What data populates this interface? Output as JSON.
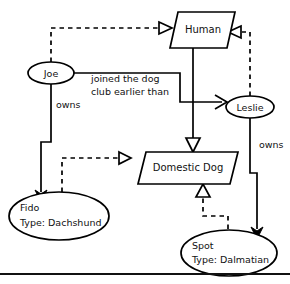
{
  "diagram": {
    "type": "uml-object-instance-diagram",
    "background_color": "#ffffff",
    "line_color": "#000000",
    "text_color": "#111111",
    "nodes": [
      {
        "id": "human",
        "label": "Human",
        "shape": "parallelogram",
        "role": "class"
      },
      {
        "id": "domestic_dog",
        "label": "Domestic Dog",
        "shape": "parallelogram",
        "role": "class"
      },
      {
        "id": "joe",
        "label": "Joe",
        "shape": "ellipse",
        "role": "instance"
      },
      {
        "id": "leslie",
        "label": "Leslie",
        "shape": "ellipse",
        "role": "instance"
      },
      {
        "id": "fido",
        "label_line1": "Fido",
        "label_line2": "Type: Dachshund",
        "shape": "ellipse",
        "role": "instance"
      },
      {
        "id": "spot",
        "label_line1": "Spot",
        "label_line2": "Type: Dalmatian",
        "shape": "ellipse",
        "role": "instance"
      }
    ],
    "edges": [
      {
        "id": "joe-instance-of-human",
        "from": "joe",
        "to": "human",
        "style": "dashed",
        "arrowhead": "hollow-triangle",
        "label": ""
      },
      {
        "id": "leslie-instance-of-human",
        "from": "leslie",
        "to": "human",
        "style": "dashed",
        "arrowhead": "hollow-triangle",
        "label": ""
      },
      {
        "id": "fido-instance-of-domestic-dog",
        "from": "fido",
        "to": "domestic_dog",
        "style": "dashed",
        "arrowhead": "hollow-triangle",
        "label": ""
      },
      {
        "id": "spot-instance-of-domestic-dog",
        "from": "spot",
        "to": "domestic_dog",
        "style": "dashed",
        "arrowhead": "hollow-triangle",
        "label": ""
      },
      {
        "id": "human-owns-domestic-dog",
        "from": "human",
        "to": "domestic_dog",
        "style": "solid",
        "arrowhead": "hollow-triangle",
        "label": ""
      },
      {
        "id": "joe-owns-fido",
        "from": "joe",
        "to": "fido",
        "style": "solid",
        "arrowhead": "filled-arrow",
        "label": "owns"
      },
      {
        "id": "leslie-owns-spot",
        "from": "leslie",
        "to": "spot",
        "style": "solid",
        "arrowhead": "filled-arrow",
        "label": "owns"
      },
      {
        "id": "joe-joined-earlier-than-leslie",
        "from": "joe",
        "to": "leslie",
        "style": "solid",
        "arrowhead": "open-arrow",
        "label_line1": "joined the dog",
        "label_line2": "club earlier than"
      }
    ],
    "labels": {
      "owns_left": "owns",
      "owns_right": "owns",
      "joined_line1": "joined the dog",
      "joined_line2": "club earlier than"
    }
  }
}
